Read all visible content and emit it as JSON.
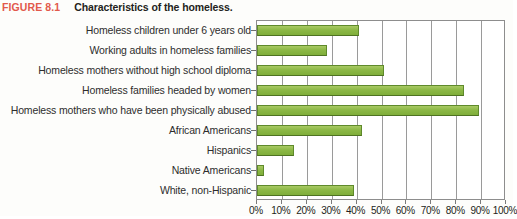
{
  "caption": {
    "figure_number": "FIGURE 8.1",
    "title": "Characteristics of the homeless.",
    "figno_color": "#e2594b",
    "title_color": "#231f20"
  },
  "colors": {
    "bar_fill": "#8cb846",
    "bar_border": "#5f8a2b",
    "gridline": "#9a9a9a",
    "axis": "#8d8d8d",
    "text": "#231f20",
    "background": "#fdfdfb"
  },
  "chart_data": {
    "type": "bar",
    "orientation": "horizontal",
    "title": "Characteristics of the homeless.",
    "xlabel": "",
    "ylabel": "",
    "categories": [
      "Homeless children under 6 years old",
      "Working adults in homeless families",
      "Homeless mothers without high school diploma",
      "Homeless families headed by women",
      "Homeless mothers who have been physically abused",
      "African Americans",
      "Hispanics",
      "Native Americans",
      "White, non-Hispanic"
    ],
    "values": [
      41,
      28,
      51,
      83,
      89,
      42,
      15,
      3,
      39
    ],
    "value_unit": "%",
    "xlim": [
      0,
      100
    ],
    "xticks": [
      0,
      10,
      20,
      30,
      40,
      50,
      60,
      70,
      80,
      90,
      100
    ],
    "xticklabels": [
      "0%",
      "10%",
      "20%",
      "30%",
      "40%",
      "50%",
      "60%",
      "70%",
      "80%",
      "90%",
      "100%"
    ],
    "grid": true,
    "grid_axis": "x",
    "legend": false,
    "legend_position": "none"
  }
}
